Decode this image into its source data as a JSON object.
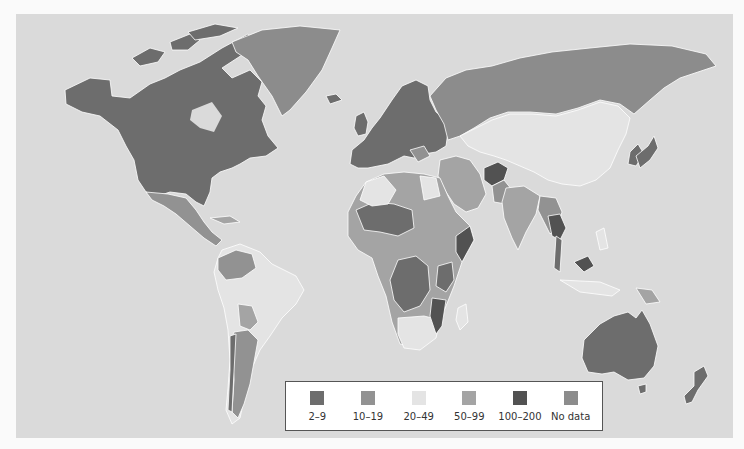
{
  "map": {
    "type": "choropleth",
    "region": "World",
    "background_color": "#dadada",
    "border_color": "#ffffff"
  },
  "legend": {
    "items": [
      {
        "label": "2–9",
        "color": "#6d6d6d"
      },
      {
        "label": "10–19",
        "color": "#929292"
      },
      {
        "label": "20–49",
        "color": "#e4e4e4"
      },
      {
        "label": "50–99",
        "color": "#a4a4a4"
      },
      {
        "label": "100–200",
        "color": "#525252"
      },
      {
        "label": "No data",
        "color": "#8c8c8c"
      }
    ]
  },
  "colors": {
    "c2_9": "#6d6d6d",
    "c10_19": "#929292",
    "c20_49": "#e4e4e4",
    "c50_99": "#a4a4a4",
    "c100_200": "#525252",
    "nodata": "#8c8c8c"
  }
}
